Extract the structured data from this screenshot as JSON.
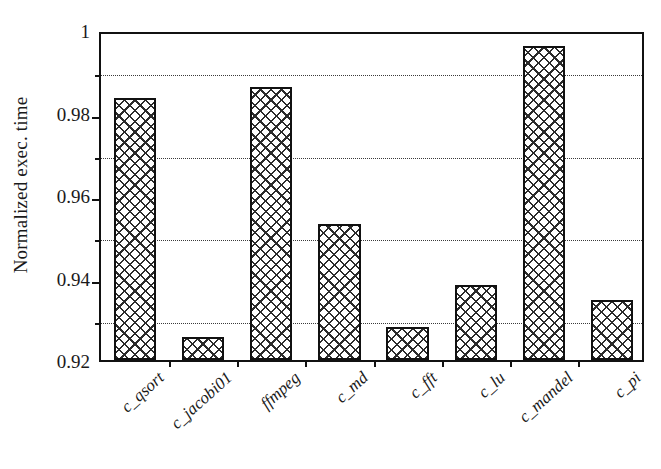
{
  "chart_data": {
    "type": "bar",
    "title": "",
    "xlabel": "",
    "ylabel": "Normalized exec. time",
    "categories": [
      "c_qsort",
      "c_jacobi01",
      "ffmpeg",
      "c_md",
      "c_fft",
      "c_lu",
      "c_mandel",
      "c_pi"
    ],
    "values": [
      0.9836,
      0.9256,
      0.9862,
      0.953,
      0.928,
      0.9383,
      0.9962,
      0.9345
    ],
    "ylim": [
      0.92,
      1.0
    ],
    "y_major_ticks": [
      0.92,
      0.94,
      0.96,
      0.98,
      1.0
    ],
    "y_major_tick_labels": [
      "0.92",
      "0.94",
      "0.96",
      "0.98",
      "1"
    ],
    "y_minor_gridlines": [
      0.93,
      0.95,
      0.97,
      0.99
    ],
    "grid": true,
    "grid_style": "dotted-horizontal-minor",
    "legend": "none",
    "bar_fill": "crosshatch",
    "bar_edge_color": "#111111",
    "bar_face_color": "#ffffff",
    "axis_color": "#111111",
    "text_color": "#1a1a1a",
    "background_color": "#ffffff",
    "x_tick_label_rotation": -42
  }
}
